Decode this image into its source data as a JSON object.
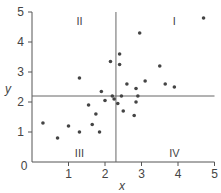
{
  "chart_data": {
    "type": "scatter",
    "title": "",
    "xlabel": "x",
    "ylabel": "y",
    "xlim": [
      0,
      5
    ],
    "ylim": [
      0,
      5
    ],
    "x_ticks": [
      "0",
      "1",
      "2",
      "3",
      "4",
      "5"
    ],
    "y_ticks": [
      "1",
      "2",
      "3",
      "4",
      "5"
    ],
    "grid": false,
    "divider_lines": {
      "x": 2.3,
      "y": 2.2
    },
    "quadrant_labels": [
      {
        "label": "I",
        "x": 3.9,
        "y": 4.7
      },
      {
        "label": "II",
        "x": 1.3,
        "y": 4.7
      },
      {
        "label": "III",
        "x": 1.3,
        "y": 0.3
      },
      {
        "label": "IV",
        "x": 3.9,
        "y": 0.3
      }
    ],
    "points": [
      {
        "x": 0.3,
        "y": 1.3
      },
      {
        "x": 0.7,
        "y": 0.8
      },
      {
        "x": 1.0,
        "y": 1.2
      },
      {
        "x": 1.3,
        "y": 1.0
      },
      {
        "x": 1.3,
        "y": 2.8
      },
      {
        "x": 1.55,
        "y": 1.9
      },
      {
        "x": 1.65,
        "y": 1.25
      },
      {
        "x": 1.75,
        "y": 1.6
      },
      {
        "x": 1.85,
        "y": 1.0
      },
      {
        "x": 1.9,
        "y": 2.35
      },
      {
        "x": 2.0,
        "y": 2.05
      },
      {
        "x": 2.15,
        "y": 3.35
      },
      {
        "x": 2.2,
        "y": 2.2
      },
      {
        "x": 2.25,
        "y": 2.1
      },
      {
        "x": 2.35,
        "y": 1.95
      },
      {
        "x": 2.4,
        "y": 3.6
      },
      {
        "x": 2.4,
        "y": 3.25
      },
      {
        "x": 2.45,
        "y": 2.2
      },
      {
        "x": 2.5,
        "y": 1.7
      },
      {
        "x": 2.6,
        "y": 2.6
      },
      {
        "x": 2.8,
        "y": 1.55
      },
      {
        "x": 2.85,
        "y": 2.45
      },
      {
        "x": 2.85,
        "y": 2.0
      },
      {
        "x": 2.9,
        "y": 2.2
      },
      {
        "x": 2.95,
        "y": 4.3
      },
      {
        "x": 3.1,
        "y": 2.7
      },
      {
        "x": 3.5,
        "y": 3.2
      },
      {
        "x": 3.65,
        "y": 2.6
      },
      {
        "x": 3.9,
        "y": 2.5
      },
      {
        "x": 4.7,
        "y": 4.8
      }
    ]
  }
}
